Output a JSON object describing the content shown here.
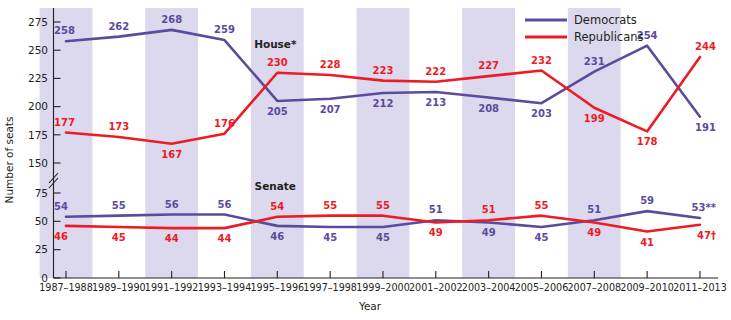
{
  "chart_data": {
    "type": "line",
    "title": "",
    "xlabel": "Year",
    "ylabel": "Number of seats",
    "grid": false,
    "legend_position": "top-right",
    "axis_break": {
      "present": true,
      "between": [
        75,
        150
      ]
    },
    "ylim": [
      0,
      275
    ],
    "yticks": [
      0,
      25,
      50,
      75,
      150,
      175,
      200,
      225,
      250,
      275
    ],
    "ytick_labels": [
      "0",
      "25",
      "50",
      "75",
      "150",
      "175",
      "200",
      "225",
      "250",
      "275"
    ],
    "categories": [
      "1987–1988",
      "1989–1990",
      "1991–1992",
      "1993–1994",
      "1995–1996",
      "1997–1998",
      "1999–2000",
      "2001–2002",
      "2003–2004",
      "2005–2006",
      "2007–2008",
      "2009–2010",
      "2011–2013"
    ],
    "chambers": [
      {
        "name": "House",
        "annotation": "House*",
        "annotation_index": 4,
        "series": [
          {
            "name": "Democrats",
            "color": "#5b4b9e",
            "values": [
              258,
              262,
              268,
              259,
              205,
              207,
              212,
              213,
              208,
              203,
              231,
              254,
              191
            ],
            "labels": [
              "258",
              "262",
              "268",
              "259",
              "205",
              "207",
              "212",
              "213",
              "208",
              "203",
              "231",
              "254",
              "191"
            ],
            "label_side": [
              "above",
              "above",
              "above",
              "above",
              "below",
              "below",
              "below",
              "below",
              "below",
              "below",
              "above",
              "above",
              "below"
            ]
          },
          {
            "name": "Republicans",
            "color": "#ed1c24",
            "values": [
              177,
              173,
              167,
              176,
              230,
              228,
              223,
              222,
              227,
              232,
              199,
              178,
              244
            ],
            "labels": [
              "177",
              "173",
              "167",
              "176",
              "230",
              "228",
              "223",
              "222",
              "227",
              "232",
              "199",
              "178",
              "244"
            ],
            "label_side": [
              "above",
              "above",
              "below",
              "above",
              "above",
              "above",
              "above",
              "above",
              "above",
              "above",
              "below",
              "below",
              "above"
            ]
          }
        ]
      },
      {
        "name": "Senate",
        "annotation": "Senate",
        "annotation_index": 4,
        "series": [
          {
            "name": "Democrats",
            "color": "#5b4b9e",
            "values": [
              54,
              55,
              56,
              56,
              46,
              45,
              45,
              51,
              49,
              45,
              51,
              59,
              53
            ],
            "labels": [
              "54",
              "55",
              "56",
              "56",
              "46",
              "45",
              "45",
              "51",
              "49",
              "45",
              "51",
              "59",
              "53**"
            ],
            "label_side": [
              "above",
              "above",
              "above",
              "above",
              "below",
              "below",
              "below",
              "above",
              "below",
              "below",
              "above",
              "above",
              "above"
            ]
          },
          {
            "name": "Republicans",
            "color": "#ed1c24",
            "values": [
              46,
              45,
              44,
              44,
              54,
              55,
              55,
              49,
              51,
              55,
              49,
              41,
              47
            ],
            "labels": [
              "46",
              "45",
              "44",
              "44",
              "54",
              "55",
              "55",
              "49",
              "51",
              "55",
              "49",
              "41",
              "47†"
            ],
            "label_side": [
              "below",
              "below",
              "below",
              "below",
              "above",
              "above",
              "above",
              "below",
              "above",
              "above",
              "below",
              "below",
              "below"
            ]
          }
        ]
      }
    ],
    "legend": [
      {
        "label": "Democrats",
        "color": "#5b4b9e"
      },
      {
        "label": "Republicans",
        "color": "#ed1c24"
      }
    ],
    "banded_columns": [
      0,
      2,
      4,
      6,
      8,
      10
    ],
    "band_color": "#dcd8ee"
  }
}
